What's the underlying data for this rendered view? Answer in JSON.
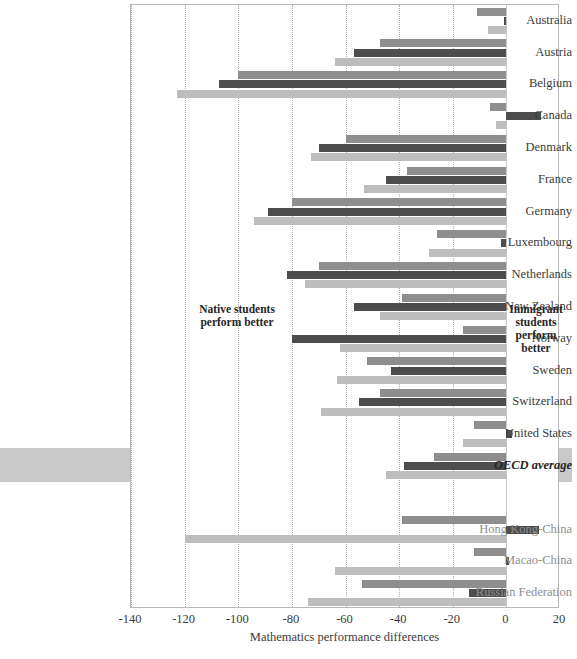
{
  "chart_data": {
    "type": "bar",
    "orientation": "horizontal",
    "title": "",
    "xlabel": "Mathematics performance differences",
    "ylabel": "",
    "xlim": [
      -140,
      20
    ],
    "xticks": [
      -140,
      -120,
      -100,
      -80,
      -60,
      -40,
      -20,
      0,
      20
    ],
    "grid": true,
    "legend_position": "none",
    "categories": [
      "Australia",
      "Austria",
      "Belgium",
      "Canada",
      "Denmark",
      "France",
      "Germany",
      "Luxembourg",
      "Netherlands",
      "New Zealand",
      "Norway",
      "Sweden",
      "Switzerland",
      "United States",
      "OECD average",
      "",
      "Hong Kong-China",
      "Macao-China",
      "Russian Federation"
    ],
    "partner_categories": [
      "Hong Kong-China",
      "Macao-China",
      "Russian Federation"
    ],
    "highlight_category": "OECD average",
    "series": [
      {
        "name": "series-1",
        "color": "#8e8e8e",
        "values": [
          -11,
          -47,
          -100,
          -6,
          -60,
          -37,
          -80,
          -26,
          -70,
          -39,
          -16,
          -52,
          -47,
          -12,
          -27,
          null,
          -39,
          -12,
          -54
        ]
      },
      {
        "name": "series-2",
        "color": "#4d4d4d",
        "values": [
          -1,
          -57,
          -107,
          13,
          -70,
          -45,
          -89,
          -2,
          -82,
          -57,
          -80,
          -43,
          -55,
          2,
          -38,
          null,
          12,
          1,
          -14
        ]
      },
      {
        "name": "series-3",
        "color": "#bdbdbd",
        "values": [
          -7,
          -64,
          -123,
          -4,
          -73,
          -53,
          -94,
          -29,
          -75,
          -47,
          -62,
          -63,
          -69,
          -16,
          -45,
          null,
          -120,
          -64,
          -74
        ]
      }
    ],
    "annotations": [
      {
        "id": "native",
        "text": "Native students\nperform better",
        "side": "left"
      },
      {
        "id": "immigrant",
        "text": "Immigrant students perform better",
        "side": "right"
      }
    ]
  },
  "annotations": {
    "native_line1": "Native students",
    "native_line2": "perform better",
    "immigrant_line1": "Immigrant",
    "immigrant_line2": "students",
    "immigrant_line3": "perform",
    "immigrant_line4": "better"
  },
  "axis": {
    "xlabel": "Mathematics performance differences",
    "ticks": [
      "-140",
      "-120",
      "-100",
      "-80",
      "-60",
      "-40",
      "-20",
      "0",
      "20"
    ]
  },
  "colors": {
    "series1": "#8e8e8e",
    "series2": "#4d4d4d",
    "series3": "#bdbdbd",
    "highlight_band": "#c9c9c9",
    "frame": "#b9b9b9",
    "gridline": "#b0b0b0"
  }
}
